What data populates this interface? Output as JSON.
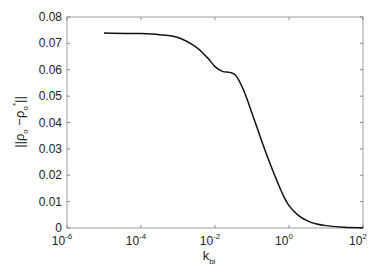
{
  "chart_data": {
    "type": "line",
    "title": "",
    "xlabel": "k_bi",
    "ylabel": "||ρ_o − ρ_o*||",
    "xscale": "log",
    "xlim": [
      1e-06,
      100
    ],
    "ylim": [
      0,
      0.08
    ],
    "grid": false,
    "legend": null,
    "x_tick_labels": [
      "10^-6",
      "10^-4",
      "10^-2",
      "10^0",
      "10^2"
    ],
    "y_tick_labels": [
      "0",
      "0.01",
      "0.02",
      "0.03",
      "0.04",
      "0.05",
      "0.06",
      "0.07",
      "0.08"
    ],
    "series": [
      {
        "name": "curve",
        "color": "#111111",
        "log10_x": [
          -5,
          -4,
          -3.5,
          -3,
          -2.5,
          -2.2,
          -2,
          -1.8,
          -1.6,
          -1.45,
          -1.3,
          -1.15,
          -1,
          -0.85,
          -0.7,
          -0.5,
          -0.3,
          -0.15,
          0,
          0.25,
          0.5,
          0.75,
          1,
          1.5,
          2
        ],
        "values": [
          0.0739,
          0.0737,
          0.0733,
          0.0722,
          0.0685,
          0.0645,
          0.0612,
          0.0594,
          0.059,
          0.058,
          0.0545,
          0.0495,
          0.0435,
          0.0375,
          0.0315,
          0.024,
          0.017,
          0.0122,
          0.0085,
          0.0048,
          0.0027,
          0.0015,
          0.0009,
          0.0003,
          0.0001
        ]
      }
    ]
  },
  "axes": {
    "y_ticks": [
      "0",
      "0.01",
      "0.02",
      "0.03",
      "0.04",
      "0.05",
      "0.06",
      "0.07",
      "0.08"
    ],
    "x_ticks": [
      {
        "base": "10",
        "exp": "-6"
      },
      {
        "base": "10",
        "exp": "-4"
      },
      {
        "base": "10",
        "exp": "-2"
      },
      {
        "base": "10",
        "exp": "0"
      },
      {
        "base": "10",
        "exp": "2"
      }
    ],
    "xlabel_main": "k",
    "xlabel_sub": "bi",
    "ylabel": "||ρ_o − ρ_o*||"
  }
}
